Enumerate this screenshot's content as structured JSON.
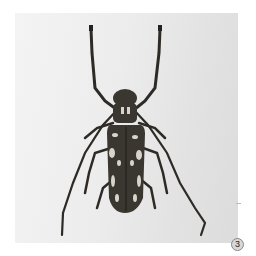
{
  "image": {
    "subject": "longhorn beetle specimen, dorsal view",
    "background_color": "#e6e6e6",
    "body_color": "#3a3630",
    "marking_color": "#d8d4cc",
    "label": "3"
  }
}
